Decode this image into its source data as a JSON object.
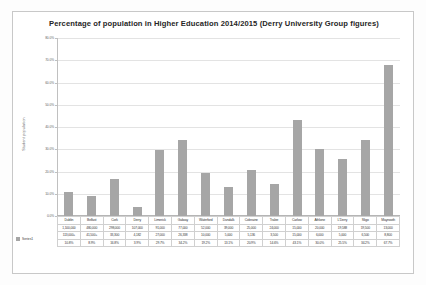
{
  "chart_data": {
    "type": "bar",
    "title": "Percentage of population in Higher Education 2014/2015 (Derry University Group figures)",
    "xlabel": "",
    "ylabel": "Student population",
    "ylim": [
      0,
      80
    ],
    "grid": true,
    "legend_position": "bottom-left",
    "y_ticks": [
      "0.0%",
      "10.0%",
      "20.0%",
      "30.0%",
      "40.0%",
      "50.0%",
      "60.0%",
      "70.0%",
      "80.0%"
    ],
    "y_tick_values": [
      0,
      10,
      20,
      30,
      40,
      50,
      60,
      70,
      80
    ],
    "categories": [
      "Dublin",
      "Belfast",
      "Cork",
      "Derry",
      "Limerick",
      "Galway",
      "Waterford",
      "Dundalk",
      "Coleraine",
      "Tralee",
      "Carlow",
      "Athlone",
      "L'Derry",
      "Sligo",
      "Maynooth"
    ],
    "values": [
      10.8,
      8.9,
      16.8,
      3.9,
      29.7,
      34.2,
      19.2,
      13.1,
      20.9,
      14.6,
      43.1,
      30.0,
      25.5,
      34.2,
      67.7
    ],
    "series": [
      {
        "name": "Series1",
        "values": [
          10.8,
          8.9,
          16.8,
          3.9,
          29.7,
          34.2,
          19.2,
          13.1,
          20.9,
          14.6,
          43.1,
          30.0,
          25.5,
          34.2,
          67.7
        ]
      }
    ],
    "table_rows": [
      {
        "label": "",
        "cells": [
          "Dublin",
          "Belfast",
          "Cork",
          "Derry",
          "Limerick",
          "Galway",
          "Waterford",
          "Dundalk",
          "Coleraine",
          "Tralee",
          "Carlow",
          "Athlone",
          "L'Derry",
          "Sligo",
          "Maynooth"
        ]
      },
      {
        "label": "",
        "cells": [
          "1,100,000",
          "480,000",
          "298,000",
          "107,000",
          "91,000",
          "77,000",
          "52,000",
          "39,000",
          "25,000",
          "24,000",
          "15,000",
          "20,000",
          "19,588",
          "19,500",
          "13,000"
        ]
      },
      {
        "label": "",
        "cells": [
          "113,000+",
          "41,500+",
          "33,300",
          "4,182",
          "27,000",
          "26,338",
          "10,000",
          "5,000",
          "5,136",
          "3,500",
          "15,000",
          "6,000",
          "5,000",
          "6,500",
          "8,800"
        ]
      },
      {
        "label": "Series1",
        "cells": [
          "10.8%",
          "8.9%",
          "16.8%",
          "3.9%",
          "29.7%",
          "34.2%",
          "19.2%",
          "13.1%",
          "20.9%",
          "14.6%",
          "43.1%",
          "30.0%",
          "25.5%",
          "34.2%",
          "67.7%"
        ]
      }
    ]
  }
}
